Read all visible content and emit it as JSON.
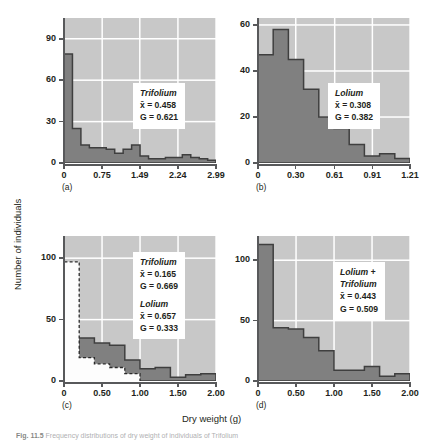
{
  "figure": {
    "axis_title_y": "Number of individuals",
    "axis_title_x": "Dry weight (g)",
    "caption_label": "Fig. 11.5",
    "caption_text": "Frequency distributions of dry weight of individuals of Trifolium"
  },
  "chart_data": [
    {
      "id": "a",
      "type": "bar",
      "panel_letter": "(a)",
      "title": "",
      "xlabel": "Dry weight (g)",
      "ylabel": "Number of individuals",
      "xlim": [
        0,
        2.99
      ],
      "ylim": [
        0,
        105
      ],
      "xticks": [
        0,
        0.75,
        1.49,
        2.24,
        2.99
      ],
      "xtick_labels": [
        "0",
        "0.75",
        "1.49",
        "2.24",
        "2.99"
      ],
      "yticks": [
        0,
        30,
        60,
        90
      ],
      "ytick_labels": [
        "0",
        "30",
        "60",
        "90"
      ],
      "grid": true,
      "bin_edges": [
        0,
        0.1663,
        0.3325,
        0.4988,
        0.665,
        0.8313,
        0.9975,
        1.1638,
        1.33,
        1.4963,
        1.6625,
        1.8288,
        1.995,
        2.1613,
        2.3275,
        2.4938,
        2.66,
        2.8263,
        2.99
      ],
      "values": [
        79,
        25,
        13,
        11,
        11,
        10,
        7,
        10,
        13,
        5,
        3,
        3,
        4,
        4,
        6,
        4,
        3,
        2
      ],
      "annotations": [
        {
          "species": "Trifolium",
          "mean_label": "x̄ = 0.458",
          "gini_label": "G = 0.621",
          "mean": 0.458,
          "gini": 0.621
        }
      ]
    },
    {
      "id": "b",
      "type": "bar",
      "panel_letter": "(b)",
      "title": "",
      "xlabel": "Dry weight (g)",
      "ylabel": "Number of individuals",
      "xlim": [
        0,
        1.21
      ],
      "ylim": [
        0,
        63
      ],
      "xticks": [
        0,
        0.3,
        0.61,
        0.91,
        1.21
      ],
      "xtick_labels": [
        "0",
        "0.30",
        "0.61",
        "0.91",
        "1.21"
      ],
      "yticks": [
        0,
        20,
        40,
        60
      ],
      "ytick_labels": [
        "0",
        "20",
        "40",
        "60"
      ],
      "grid": true,
      "bin_edges": [
        0,
        0.121,
        0.242,
        0.363,
        0.484,
        0.605,
        0.726,
        0.847,
        0.968,
        1.089,
        1.21
      ],
      "values": [
        47,
        58,
        45,
        32,
        20,
        15,
        8,
        3,
        4,
        2
      ],
      "annotations": [
        {
          "species": "Lolium",
          "mean_label": "x̄ = 0.308",
          "gini_label": "G = 0.382",
          "mean": 0.308,
          "gini": 0.382
        }
      ]
    },
    {
      "id": "c",
      "type": "bar",
      "panel_letter": "(c)",
      "title": "",
      "xlabel": "Dry weight (g)",
      "ylabel": "Number of individuals",
      "xlim": [
        0,
        2.0
      ],
      "ylim": [
        0,
        118
      ],
      "xticks": [
        0,
        0.5,
        1.0,
        1.5,
        2.0
      ],
      "xtick_labels": [
        "0",
        "0.50",
        "1.00",
        "1.50",
        "2.00"
      ],
      "yticks": [
        0,
        50,
        100
      ],
      "ytick_labels": [
        "0",
        "50",
        "100"
      ],
      "grid": true,
      "bin_edges": [
        0,
        0.2,
        0.4,
        0.6,
        0.8,
        1.0,
        1.2,
        1.4,
        1.6,
        1.8,
        2.0
      ],
      "series": [
        {
          "name": "Trifolium",
          "style": "white-dashed",
          "values": [
            97,
            19,
            14,
            11,
            6,
            0,
            0,
            0,
            0,
            0
          ]
        },
        {
          "name": "Lolium",
          "style": "gray-solid",
          "values": [
            23,
            35,
            31,
            29,
            17,
            10,
            11,
            3,
            5,
            6
          ]
        }
      ],
      "annotations": [
        {
          "species": "Trifolium",
          "mean_label": "x̄ = 0.165",
          "gini_label": "G = 0.669",
          "mean": 0.165,
          "gini": 0.669
        },
        {
          "species": "Lolium",
          "mean_label": "x̄ = 0.657",
          "gini_label": "G = 0.333",
          "mean": 0.657,
          "gini": 0.333
        }
      ]
    },
    {
      "id": "d",
      "type": "bar",
      "panel_letter": "(d)",
      "title": "",
      "xlabel": "Dry weight (g)",
      "ylabel": "Number of individuals",
      "xlim": [
        0,
        2.0
      ],
      "ylim": [
        0,
        120
      ],
      "xticks": [
        0,
        0.5,
        1.0,
        1.5,
        2.0
      ],
      "xtick_labels": [
        "0",
        "0.50",
        "1.00",
        "1.50",
        "2.00"
      ],
      "yticks": [
        0,
        50,
        100
      ],
      "ytick_labels": [
        "0",
        "50",
        "100"
      ],
      "grid": true,
      "bin_edges": [
        0,
        0.2,
        0.4,
        0.6,
        0.8,
        1.0,
        1.2,
        1.4,
        1.6,
        1.8,
        2.0
      ],
      "values": [
        113,
        44,
        43,
        36,
        25,
        9,
        9,
        12,
        4,
        6
      ],
      "annotations": [
        {
          "species": "Lolium + Trifolium",
          "species_line1": "Lolium +",
          "species_line2": "Trifolium",
          "mean_label": "x̄ = 0.443",
          "gini_label": "G = 0.509",
          "mean": 0.443,
          "gini": 0.509
        }
      ]
    }
  ],
  "colors": {
    "plot_background": "#c8c8c8",
    "gridline": "#ffffff",
    "bar_fill": "#808080",
    "bar_stroke": "#3f3f3f",
    "white_bar_fill": "#fdfdfd",
    "axis": "#58595b",
    "text": "#231f20",
    "annotation_background": "#ffffff"
  }
}
